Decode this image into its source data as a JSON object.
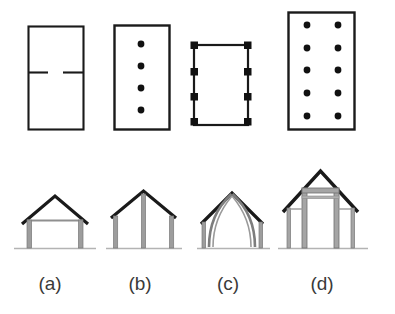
{
  "figure": {
    "background_color": "#ffffff",
    "ink_color": "#1a1a1a",
    "ground_color": "#a8a8a8",
    "timber_color": "#9a9a9a",
    "rows": [
      {
        "id": "plans",
        "caption": "Plan views (roof / column layout)"
      },
      {
        "id": "sections",
        "caption": "Cross sections (frame types)"
      }
    ],
    "labels": [
      {
        "key": "a",
        "text": "(a)",
        "x": 50,
        "y": 290
      },
      {
        "key": "b",
        "text": "(b)",
        "x": 140,
        "y": 290
      },
      {
        "key": "c",
        "text": "(c)",
        "x": 228,
        "y": 290
      },
      {
        "key": "d",
        "text": "(d)",
        "x": 322,
        "y": 290
      }
    ],
    "panels": [
      {
        "key": "a",
        "label": "(a)",
        "plan": {
          "name": "plan-a-partition",
          "description": "Rectangular outline with a single internal cross wall broken by a central doorway gap",
          "rect": {
            "x": 28,
            "y": 26,
            "w": 55,
            "h": 103
          },
          "dots": [],
          "dot_shape": "none",
          "internal_wall": {
            "y": 72,
            "gap_start": 48,
            "gap_end": 63
          }
        },
        "section": {
          "name": "section-a-tie-beam-truss",
          "description": "Simple gable truss on two wall posts with a tie beam",
          "posts": 2,
          "apex_x": 55,
          "apex_y": 196,
          "eaves_y": 222,
          "ground_y": 248,
          "left_x": 24,
          "right_x": 86,
          "has_tie_beam": true,
          "has_king_post": false,
          "curved_blades": false,
          "aisles": false
        }
      },
      {
        "key": "b",
        "label": "(b)",
        "plan": {
          "name": "plan-b-central-posts",
          "description": "Rectangular outline with a single row of four round columns on the centre line",
          "rect": {
            "x": 114,
            "y": 25,
            "w": 55,
            "h": 104
          },
          "dot_shape": "circle",
          "dot_radius": 3.4,
          "dots": [
            {
              "x": 141,
              "y": 44
            },
            {
              "x": 141,
              "y": 65
            },
            {
              "x": 141,
              "y": 88
            },
            {
              "x": 141,
              "y": 110
            }
          ],
          "internal_wall": null
        },
        "section": {
          "name": "section-b-king-post-truss",
          "description": "Gable truss with a central king post reaching the apex and two wall posts",
          "posts": 3,
          "apex_x": 143,
          "apex_y": 191,
          "eaves_y": 218,
          "ground_y": 248,
          "left_x": 113,
          "right_x": 174,
          "has_tie_beam": false,
          "has_king_post": true,
          "curved_blades": false,
          "aisles": false
        }
      },
      {
        "key": "c",
        "label": "(c)",
        "plan": {
          "name": "plan-c-perimeter-posts",
          "description": "Rectangular outline with four square posts embedded in each of the two long walls",
          "rect": {
            "x": 193,
            "y": 44,
            "w": 55,
            "h": 81
          },
          "dot_shape": "square",
          "dot_size": 7,
          "dots": [
            {
              "x": 195,
              "y": 46
            },
            {
              "x": 195,
              "y": 72
            },
            {
              "x": 195,
              "y": 96
            },
            {
              "x": 195,
              "y": 120
            },
            {
              "x": 244,
              "y": 46
            },
            {
              "x": 244,
              "y": 72
            },
            {
              "x": 244,
              "y": 96
            },
            {
              "x": 244,
              "y": 120
            }
          ],
          "internal_wall": null
        },
        "section": {
          "name": "section-c-cruck-frame",
          "description": "Cruck frame: curved blades springing from ground level up to the apex under a gable roof",
          "posts": 2,
          "apex_x": 232,
          "apex_y": 192,
          "eaves_y": 222,
          "ground_y": 248,
          "left_x": 203,
          "right_x": 262,
          "has_tie_beam": false,
          "has_king_post": false,
          "curved_blades": true,
          "aisles": false
        }
      },
      {
        "key": "d",
        "label": "(d)",
        "plan": {
          "name": "plan-d-two-rows-posts",
          "description": "Larger rectangular outline with two rows of five round columns forming aisles",
          "rect": {
            "x": 288,
            "y": 12,
            "w": 66,
            "h": 117
          },
          "dot_shape": "circle",
          "dot_radius": 3.4,
          "dots": [
            {
              "x": 306,
              "y": 25
            },
            {
              "x": 306,
              "y": 48
            },
            {
              "x": 306,
              "y": 70
            },
            {
              "x": 306,
              "y": 93
            },
            {
              "x": 306,
              "y": 115
            },
            {
              "x": 338,
              "y": 25
            },
            {
              "x": 338,
              "y": 48
            },
            {
              "x": 338,
              "y": 70
            },
            {
              "x": 338,
              "y": 93
            },
            {
              "x": 338,
              "y": 115
            }
          ],
          "internal_wall": null
        },
        "section": {
          "name": "section-d-aisled-frame",
          "description": "Aisled frame: tall central posts with tie beam carrying the main gable, flanked by lower outer aisle posts and catslide roofs",
          "posts": 4,
          "apex_x": 320,
          "apex_y": 171,
          "eaves_y": 212,
          "ground_y": 248,
          "left_x": 283,
          "right_x": 358,
          "inner_left_x": 302,
          "inner_right_x": 339,
          "has_tie_beam": true,
          "has_king_post": false,
          "curved_blades": false,
          "aisles": true
        }
      }
    ]
  }
}
